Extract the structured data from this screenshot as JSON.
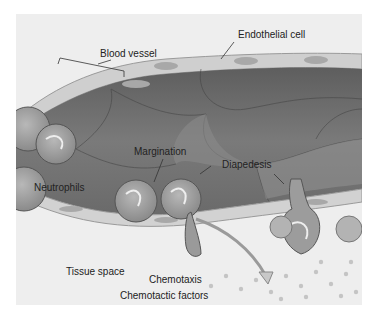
{
  "figure": {
    "type": "illustration",
    "labels": {
      "blood_vessel": "Blood vessel",
      "endothelial_cell": "Endothelial cell",
      "margination": "Margination",
      "diapedesis": "Diapedesis",
      "neutrophils": "Neutrophils",
      "tissue_space": "Tissue space",
      "chemotaxis": "Chemotaxis",
      "chemotactic_factors": "Chemotactic factors"
    },
    "colors": {
      "background": "#ffffff",
      "panel": "#eeeeee",
      "vessel_lumen": "#6f6f6f",
      "vessel_cells": "#8e8e8e",
      "endothelium": "#d4d4d4",
      "neutrophil": "#a9a9a9",
      "arrow": "#c8c8c8",
      "dots": "#c4c4c4",
      "text": "#222222"
    }
  }
}
